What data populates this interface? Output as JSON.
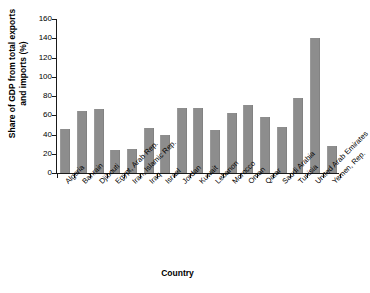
{
  "chart_data": {
    "type": "bar",
    "title": "",
    "xlabel": "Country",
    "ylabel": "Share of GDP from total exports and imports (%)",
    "ylabel_line1": "Share of GDP from total exports",
    "ylabel_line2": "and imports (%)",
    "ylim": [
      0,
      160
    ],
    "ytick_step": 20,
    "yticks": [
      0,
      20,
      40,
      60,
      80,
      100,
      120,
      140,
      160
    ],
    "ytick_labels": [
      "0",
      "20",
      "40",
      "60",
      "80",
      "100",
      "120",
      "140",
      "160"
    ],
    "grid": false,
    "legend": "none",
    "bar_color": "#8d8d8d",
    "axis_color": "#1a1a1a",
    "background": "#ffffff",
    "categories": [
      "Algeria",
      "Bahrain",
      "Djibouti",
      "Egypt, Arab Rep.",
      "Iran, Islamic Rep.",
      "Iraq",
      "Israel",
      "Jordan",
      "Kuwait",
      "Lebanon",
      "Morocco",
      "Oman",
      "Qatar",
      "Saudi Arabia",
      "Tunisia",
      "United Arab Emirates",
      "Yemen, Rep."
    ],
    "values": [
      46,
      64,
      67,
      24,
      25,
      47,
      40,
      68,
      68,
      45,
      62,
      71,
      58,
      48,
      78,
      140,
      28
    ]
  }
}
